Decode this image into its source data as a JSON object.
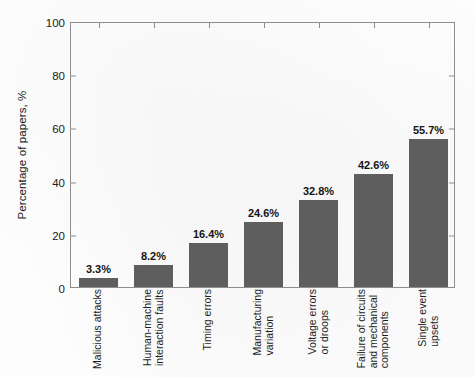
{
  "chart_data": {
    "type": "bar",
    "title": "",
    "subtitle": "",
    "xlabel": "",
    "ylabel": "Percentage of papers, %",
    "ylim": [
      0,
      100
    ],
    "yticks": [
      0,
      20,
      40,
      60,
      80,
      100
    ],
    "ytick_labels": [
      "0",
      "20",
      "40",
      "60",
      "80",
      "100"
    ],
    "grid": false,
    "legend": "none",
    "bar_color": "#5e5e5e",
    "axis_color": "#8d8d8d",
    "categories": [
      "Malicious attacks",
      "Human-machine interaction faults",
      "Timing errors",
      "Manufacturing variation",
      "Voltage errors or droops",
      "Failure of circuits and mechanical components",
      "Single event upsets"
    ],
    "category_lines": [
      [
        "Malicious attacks"
      ],
      [
        "Human-machine",
        "interaction faults"
      ],
      [
        "Timing errors"
      ],
      [
        "Manufacturing",
        "variation"
      ],
      [
        "Voltage errors",
        "or droops"
      ],
      [
        "Failure of circuits",
        "and mechanical",
        "components"
      ],
      [
        "Single event",
        "upsets"
      ]
    ],
    "values": [
      3.3,
      8.2,
      16.4,
      24.6,
      32.8,
      42.6,
      55.7
    ],
    "value_labels": [
      "3.3%",
      "8.2%",
      "16.4%",
      "24.6%",
      "32.8%",
      "42.6%",
      "55.7%"
    ]
  }
}
